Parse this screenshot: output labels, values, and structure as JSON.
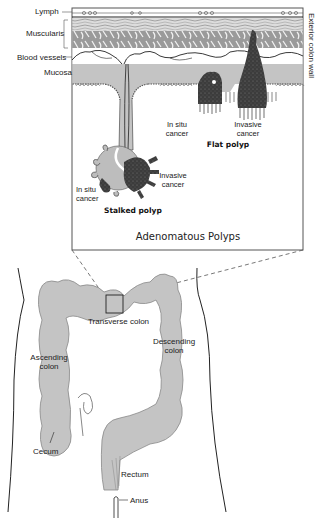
{
  "inset": {
    "title": "Adenomatous Polyps",
    "layers": {
      "lymph": "Lymph",
      "muscularis": "Muscularis",
      "blood_vessels": "Blood vessels",
      "mucosa": "Mucosa"
    },
    "side_label": "Exterior colon wall",
    "stalked_polyp": {
      "name": "Stalked polyp",
      "in_situ_line1": "In situ",
      "in_situ_line2": "cancer",
      "invasive_line1": "Invasive",
      "invasive_line2": "cancer"
    },
    "flat_polyp": {
      "name": "Flat polyp",
      "in_situ_line1": "In situ",
      "in_situ_line2": "cancer",
      "invasive_line1": "Invasive",
      "invasive_line2": "cancer"
    }
  },
  "colon": {
    "transverse_line1": "Transverse colon",
    "ascending_line1": "Ascending",
    "ascending_line2": "colon",
    "descending_line1": "Descending",
    "descending_line2": "colon",
    "cecum": "Cecum",
    "rectum": "Rectum",
    "anus": "Anus"
  },
  "colors": {
    "tissue_gray": "#c4c4c4",
    "cancer_dark": "#3a3a3a",
    "outline": "#333333"
  }
}
